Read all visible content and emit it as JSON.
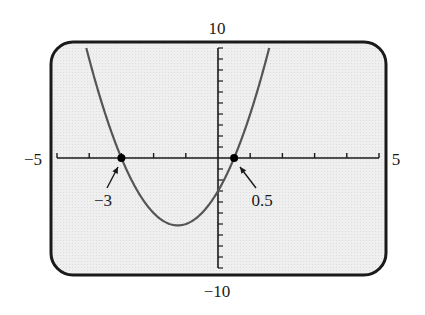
{
  "chart_data": {
    "type": "line",
    "title": "",
    "function": "y = 2x^2 + 5x - 3",
    "xlabel": "",
    "ylabel": "",
    "xlim": [
      -5,
      5
    ],
    "ylim": [
      -10,
      10
    ],
    "x_tick_step": 1,
    "y_tick_step": 1,
    "grid": false,
    "legend": null,
    "axis_labels": {
      "x_min": "−5",
      "x_max": "5",
      "y_max": "10",
      "y_min": "−10"
    },
    "series": [
      {
        "name": "parabola",
        "coefficients": {
          "a": 2,
          "b": 5,
          "c": -3
        },
        "x": [
          -4.09,
          -3.5,
          -3,
          -2.5,
          -2,
          -1.5,
          -1.25,
          -1,
          -0.5,
          0,
          0.5,
          1,
          1.59
        ],
        "y": [
          10,
          4,
          0,
          -3,
          -5,
          -6,
          -6.125,
          -6,
          -4.5,
          -3,
          0,
          4,
          10
        ]
      }
    ],
    "points": [
      {
        "x": -3,
        "y": 0,
        "label": "−3"
      },
      {
        "x": 0.5,
        "y": 0,
        "label": "0.5"
      }
    ],
    "annotations": [
      {
        "text": "−3",
        "target": {
          "x": -3,
          "y": 0
        },
        "arrow": true
      },
      {
        "text": "0.5",
        "target": {
          "x": 0.5,
          "y": 0
        },
        "arrow": true
      }
    ]
  },
  "colors": {
    "frame": "#1a1a1a",
    "screen_bg": "#ececec",
    "curve": "#555555",
    "axis": "#1a1a1a",
    "point": "#000000"
  }
}
